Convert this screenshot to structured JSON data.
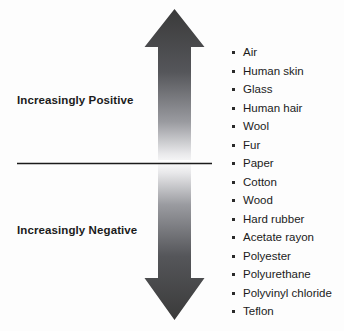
{
  "diagram": {
    "type": "triboelectric-series",
    "background_color": "#fdfdfd",
    "arrow": {
      "name": "vertical-double-headed-arrow",
      "direction": "double",
      "gradient_dark_color": "#3a3a3a",
      "gradient_light_color": "#ffffff",
      "top_tip_meaning": "most positive",
      "bottom_tip_meaning": "most negative"
    },
    "divider": {
      "name": "neutral-divider-line",
      "color": "#1b1b1b"
    },
    "labels": {
      "positive": "Increasingly Positive",
      "negative": "Increasingly Negative"
    },
    "materials": [
      "Air",
      "Human skin",
      "Glass",
      "Human hair",
      "Wool",
      "Fur",
      "Paper",
      "Cotton",
      "Wood",
      "Hard rubber",
      "Acetate rayon",
      "Polyester",
      "Polyurethane",
      "Polyvinyl chloride",
      "Teflon"
    ]
  }
}
